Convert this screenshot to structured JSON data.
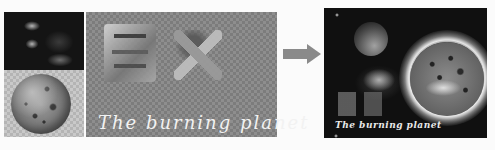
{
  "figure": {
    "source_panels": {
      "nebula": "dark nebula background image",
      "planet": "grey cratered planet on transparent background"
    },
    "text_panel": {
      "caption": "The burning planet",
      "glyphs": "3D stone-textured Chinese characters on transparent background"
    },
    "arrow": "right-arrow",
    "result_panel": {
      "caption": "The burning planet",
      "description": "composited space scene with burning planet"
    }
  }
}
